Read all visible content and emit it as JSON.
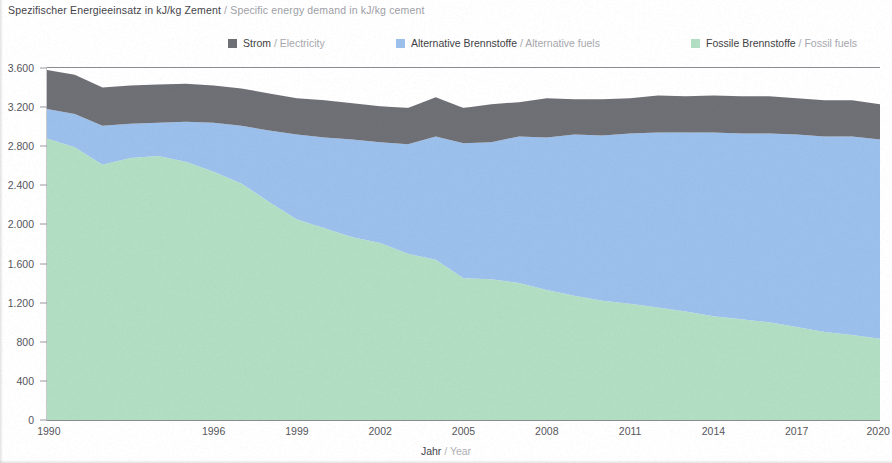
{
  "title": {
    "de": "Spezifischer Energieeinsatz in kJ/kg Zement",
    "separator": " / ",
    "en": "Specific energy demand in kJ/kg cement"
  },
  "legend": [
    {
      "de": "Strom",
      "separator": " / ",
      "en": "Electricity",
      "color": "#6f6f76",
      "key": "electricity"
    },
    {
      "de": "Alternative Brennstoffe",
      "separator": " / ",
      "en": "Alternative fuels",
      "color": "#9cc0ec",
      "key": "alternative_fuels"
    },
    {
      "de": "Fossile Brennstoffe",
      "separator": " / ",
      "en": "Fossil fuels",
      "color": "#b2dfc3",
      "key": "fossil_fuels"
    }
  ],
  "axis": {
    "x_label_de": "Jahr",
    "x_label_separator": " / ",
    "x_label_en": "Year",
    "y_ticks": [
      "0",
      "400",
      "800",
      "1.200",
      "1.600",
      "2.000",
      "2.400",
      "2.800",
      "3.200",
      "3.600"
    ],
    "x_ticks": [
      "1990",
      "1996",
      "1999",
      "2002",
      "2005",
      "2008",
      "2011",
      "2014",
      "2017",
      "2020"
    ]
  },
  "chart_data": {
    "type": "area",
    "stacked": true,
    "title": "Spezifischer Energieeinsatz in kJ/kg Zement / Specific energy demand in kJ/kg cement",
    "xlabel": "Jahr / Year",
    "ylabel": "kJ/kg Zement",
    "ylim": [
      0,
      3600
    ],
    "ytick_step": 400,
    "grid": true,
    "legend_position": "top",
    "x": [
      1990,
      1991,
      1992,
      1993,
      1994,
      1995,
      1996,
      1997,
      1998,
      1999,
      2000,
      2001,
      2002,
      2003,
      2004,
      2005,
      2006,
      2007,
      2008,
      2009,
      2010,
      2011,
      2012,
      2013,
      2014,
      2015,
      2016,
      2017,
      2018,
      2019,
      2020
    ],
    "x_tick_labels": [
      "1990",
      "1996",
      "1999",
      "2002",
      "2005",
      "2008",
      "2011",
      "2014",
      "2017",
      "2020"
    ],
    "series": [
      {
        "name": "Fossile Brennstoffe / Fossil fuels",
        "color": "#b2dfc3",
        "values": [
          2880,
          2790,
          2610,
          2680,
          2700,
          2640,
          2540,
          2420,
          2230,
          2050,
          1960,
          1870,
          1810,
          1700,
          1640,
          1450,
          1440,
          1400,
          1330,
          1270,
          1220,
          1190,
          1150,
          1110,
          1060,
          1030,
          1000,
          950,
          900,
          870,
          830
        ]
      },
      {
        "name": "Alternative Brennstoffe / Alternative fuels",
        "color": "#9cc0ec",
        "values": [
          300,
          340,
          400,
          350,
          340,
          410,
          500,
          590,
          730,
          870,
          930,
          1000,
          1030,
          1120,
          1260,
          1380,
          1400,
          1500,
          1560,
          1650,
          1690,
          1740,
          1790,
          1830,
          1880,
          1900,
          1930,
          1970,
          2000,
          2030,
          2040
        ]
      },
      {
        "name": "Strom / Electricity",
        "color": "#6f6f76",
        "values": [
          400,
          400,
          390,
          390,
          390,
          390,
          380,
          380,
          380,
          370,
          380,
          370,
          370,
          370,
          400,
          360,
          390,
          350,
          400,
          360,
          370,
          360,
          380,
          370,
          380,
          380,
          380,
          370,
          370,
          370,
          360
        ]
      }
    ],
    "totals": [
      3580,
      3530,
      3400,
      3420,
      3430,
      3440,
      3420,
      3390,
      3340,
      3290,
      3270,
      3240,
      3210,
      3190,
      3300,
      3190,
      3230,
      3250,
      3290,
      3280,
      3280,
      3290,
      3320,
      3310,
      3320,
      3310,
      3310,
      3290,
      3270,
      3270,
      3230
    ]
  }
}
